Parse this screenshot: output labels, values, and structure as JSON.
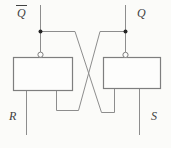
{
  "diagram": {
    "kind": "sr-latch-cross-coupled-gates",
    "labels": {
      "q_bar": "Q",
      "q": "Q",
      "r": "R",
      "s": "S"
    },
    "colors": {
      "background": "#fbfbf9",
      "wire": "#8d8d8d",
      "gate_border": "#7e7e7e",
      "gate_fill": "#fdfdfc",
      "dot": "#262626",
      "label": "#414141"
    }
  }
}
